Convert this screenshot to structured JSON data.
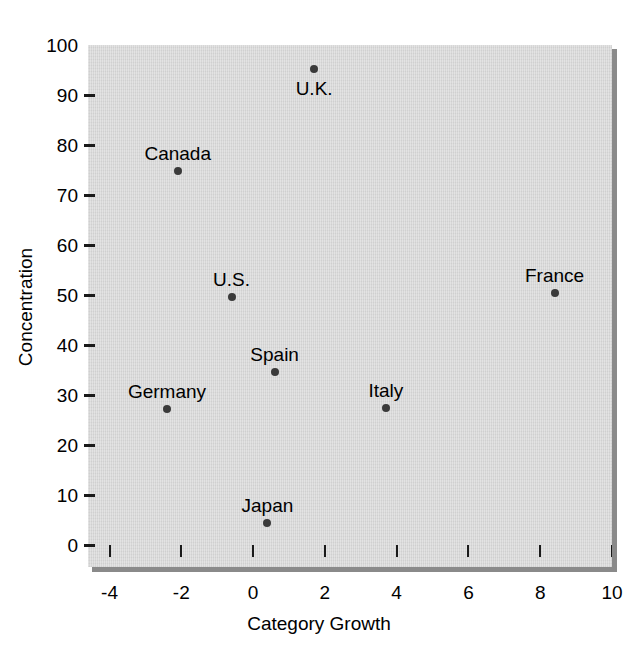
{
  "chart_data": {
    "type": "scatter",
    "title": "",
    "xlabel": "Category Growth",
    "ylabel": "Concentration",
    "xlim": [
      -4.6,
      10.0
    ],
    "ylim": [
      0,
      100
    ],
    "xticks": [
      "-4",
      "-2",
      "0",
      "2",
      "4",
      "6",
      "8",
      "10"
    ],
    "xtick_values": [
      -4,
      -2,
      0,
      2,
      4,
      6,
      8,
      10
    ],
    "yticks": [
      "0",
      "10",
      "20",
      "30",
      "40",
      "50",
      "60",
      "70",
      "80",
      "90",
      "100"
    ],
    "ytick_values": [
      0,
      10,
      20,
      30,
      40,
      50,
      60,
      70,
      80,
      90,
      100
    ],
    "grid": false,
    "legend": "none",
    "plot_background": "#d7d7d7",
    "marker_color": "#3a3a3a",
    "points": [
      {
        "label": "U.K.",
        "x": 1.7,
        "y": 95.2,
        "label_pos": "below"
      },
      {
        "label": "Canada",
        "x": -2.1,
        "y": 74.8,
        "label_pos": "above"
      },
      {
        "label": "U.S.",
        "x": -0.6,
        "y": 49.6,
        "label_pos": "above"
      },
      {
        "label": "France",
        "x": 8.4,
        "y": 50.4,
        "label_pos": "above"
      },
      {
        "label": "Spain",
        "x": 0.6,
        "y": 34.6,
        "label_pos": "above"
      },
      {
        "label": "Germany",
        "x": -2.4,
        "y": 27.2,
        "label_pos": "above"
      },
      {
        "label": "Italy",
        "x": 3.7,
        "y": 27.4,
        "label_pos": "above"
      },
      {
        "label": "Japan",
        "x": 0.4,
        "y": 4.4,
        "label_pos": "above"
      }
    ]
  }
}
